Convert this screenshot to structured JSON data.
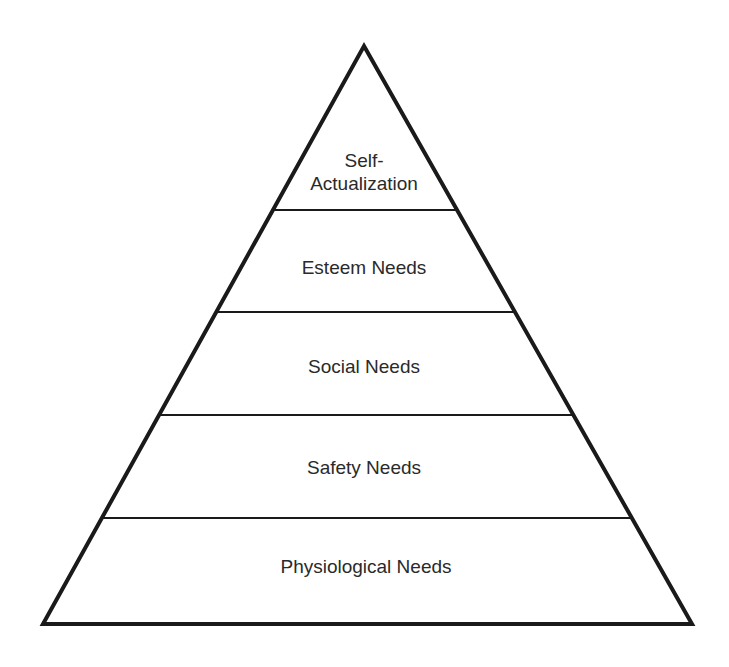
{
  "diagram": {
    "canvas": {
      "width": 729,
      "height": 667,
      "background": "#ffffff"
    },
    "pyramid": {
      "apex": [
        364,
        46
      ],
      "base_left": [
        43,
        624
      ],
      "base_right": [
        692,
        624
      ],
      "outline_color": "#1a1a1a",
      "outline_width": 4,
      "divider_color": "#1a1a1a",
      "divider_width": 2
    },
    "dividers_y": [
      210,
      312,
      415,
      518
    ],
    "levels": [
      {
        "name": "self-actualization",
        "lines": [
          "Self-",
          "Actualization"
        ],
        "center": [
          364,
          172
        ]
      },
      {
        "name": "esteem",
        "lines": [
          "Esteem Needs"
        ],
        "center": [
          364,
          267
        ]
      },
      {
        "name": "social",
        "lines": [
          "Social Needs"
        ],
        "center": [
          364,
          366
        ]
      },
      {
        "name": "safety",
        "lines": [
          "Safety Needs"
        ],
        "center": [
          364,
          467
        ]
      },
      {
        "name": "physiological",
        "lines": [
          "Physiological Needs"
        ],
        "center": [
          366,
          566
        ]
      }
    ]
  }
}
